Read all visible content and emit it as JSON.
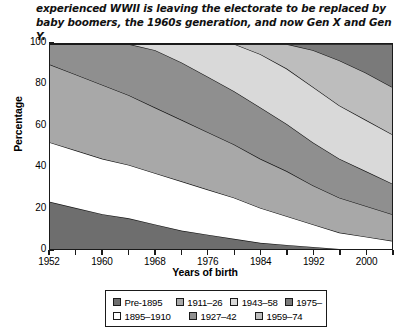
{
  "caption": "experienced WWII is leaving the electorate to be replaced by baby boomers, the 1960s generation, and now Gen X and Gen Y.",
  "chart_data": {
    "type": "area",
    "title": "",
    "xlabel": "Years of birth",
    "ylabel": "Percentage",
    "xlim": [
      1952,
      2004
    ],
    "ylim": [
      0,
      100
    ],
    "xticks": [
      1952,
      1960,
      1968,
      1976,
      1984,
      1992,
      2000
    ],
    "yticks": [
      0,
      20,
      40,
      60,
      80,
      100
    ],
    "grid": false,
    "legend_position": "bottom",
    "stacked": true,
    "x": [
      1952,
      1956,
      1960,
      1964,
      1968,
      1972,
      1976,
      1980,
      1984,
      1988,
      1992,
      1996,
      2000,
      2004
    ],
    "series": [
      {
        "name": "Pre-1895",
        "color": "#6e6e6e",
        "values": [
          23,
          20,
          17,
          15,
          12,
          9,
          7,
          5,
          3,
          2,
          1,
          0,
          0,
          0
        ]
      },
      {
        "name": "1895–1910",
        "color": "#ffffff",
        "values": [
          29,
          28,
          27,
          26,
          25,
          24,
          22,
          20,
          17,
          14,
          11,
          8,
          6,
          4
        ]
      },
      {
        "name": "1911–26",
        "color": "#a8a8a8",
        "values": [
          38,
          37,
          36,
          34,
          32,
          30,
          28,
          26,
          24,
          22,
          19,
          17,
          15,
          13
        ]
      },
      {
        "name": "1927–42",
        "color": "#8f8f8f",
        "values": [
          10,
          15,
          20,
          25,
          28,
          28,
          27,
          26,
          25,
          23,
          21,
          19,
          17,
          15
        ]
      },
      {
        "name": "1943–58",
        "color": "#d9d9d9",
        "values": [
          0,
          0,
          0,
          0,
          3,
          9,
          16,
          23,
          26,
          27,
          27,
          26,
          25,
          24
        ]
      },
      {
        "name": "1959–74",
        "color": "#bdbdbd",
        "values": [
          0,
          0,
          0,
          0,
          0,
          0,
          0,
          0,
          5,
          12,
          18,
          22,
          23,
          23
        ]
      },
      {
        "name": "1975–",
        "color": "#7a7a7a",
        "values": [
          0,
          0,
          0,
          0,
          0,
          0,
          0,
          0,
          0,
          0,
          3,
          8,
          14,
          21
        ]
      }
    ]
  },
  "legend": {
    "rows": [
      [
        {
          "label": "Pre-1895",
          "color": "#6e6e6e",
          "width": 76
        },
        {
          "label": "1911–26",
          "color": "#a8a8a8",
          "width": 66
        },
        {
          "label": "1943–58",
          "color": "#d9d9d9",
          "width": 66
        },
        {
          "label": "1975–",
          "color": "#7a7a7a",
          "width": 50
        }
      ],
      [
        {
          "label": "1895–1910",
          "color": "#ffffff",
          "width": 76
        },
        {
          "label": "1927–42",
          "color": "#8f8f8f",
          "width": 66
        },
        {
          "label": "1959–74",
          "color": "#bdbdbd",
          "width": 66
        }
      ]
    ]
  }
}
